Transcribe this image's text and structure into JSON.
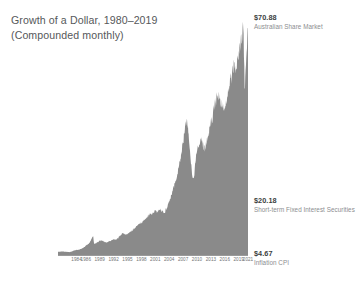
{
  "title": {
    "line1": "Growth of a Dollar, 1980–2019",
    "line2": "(Compounded monthly)"
  },
  "labels": {
    "equities": {
      "value": "$70.88",
      "name": "Australian Share Market"
    },
    "fixed": {
      "value": "$20.18",
      "name": "Short-term Fixed Interest Securities"
    },
    "inflation": {
      "value": "$4.67",
      "name": "Inflation CPI"
    }
  },
  "colors": {
    "area_fill": "#8a8a8a",
    "axis": "#9a9a9a",
    "title_text": "#56585a",
    "tick_text": "#707274",
    "value_text": "#3d3f41",
    "name_text": "#8b8d8f",
    "background": "#ffffff"
  },
  "chart_data": {
    "type": "area",
    "title": "Growth of a Dollar, 1980–2019 (Compounded monthly)",
    "xlabel": "",
    "ylabel": "",
    "grid": false,
    "legend_position": "right-inline-endpoint-labels",
    "yscale": "linear",
    "ylim": [
      0,
      75
    ],
    "xlim": [
      1980,
      2021
    ],
    "tick_labels": [
      "1984",
      "1986",
      "1989",
      "1992",
      "1995",
      "1998",
      "2001",
      "2004",
      "2007",
      "2010",
      "2013",
      "2016",
      "2019",
      "2021"
    ],
    "tick_values": [
      1984,
      1986,
      1989,
      1992,
      1995,
      1998,
      2001,
      2004,
      2007,
      2010,
      2013,
      2016,
      2019,
      2021
    ],
    "endpoint_labels": [
      {
        "label": "Australian Share Market",
        "value": 70.88,
        "display": "$70.88"
      },
      {
        "label": "Short-term Fixed Interest Securities",
        "value": 20.18,
        "display": "$20.18"
      },
      {
        "label": "Inflation CPI",
        "value": 4.67,
        "display": "$4.67"
      }
    ],
    "series": [
      {
        "name": "Australian Share Market",
        "x": [
          1980.0,
          1980.5,
          1981.0,
          1981.5,
          1982.0,
          1982.5,
          1983.0,
          1983.5,
          1984.0,
          1984.5,
          1985.0,
          1985.5,
          1986.0,
          1986.5,
          1987.0,
          1987.3,
          1987.6,
          1987.8,
          1988.0,
          1988.5,
          1989.0,
          1989.5,
          1990.0,
          1990.5,
          1991.0,
          1991.5,
          1992.0,
          1992.5,
          1993.0,
          1993.5,
          1994.0,
          1994.5,
          1995.0,
          1995.5,
          1996.0,
          1996.5,
          1997.0,
          1997.5,
          1998.0,
          1998.5,
          1999.0,
          1999.5,
          2000.0,
          2000.5,
          2001.0,
          2001.5,
          2002.0,
          2002.5,
          2003.0,
          2003.5,
          2004.0,
          2004.5,
          2005.0,
          2005.5,
          2006.0,
          2006.5,
          2007.0,
          2007.5,
          2007.8,
          2008.0,
          2008.5,
          2009.0,
          2009.3,
          2009.8,
          2010.0,
          2010.5,
          2011.0,
          2011.5,
          2012.0,
          2012.5,
          2013.0,
          2013.5,
          2014.0,
          2014.5,
          2015.0,
          2015.5,
          2016.0,
          2016.5,
          2017.0,
          2017.5,
          2018.0,
          2018.5,
          2019.0,
          2019.5,
          2020.0,
          2020.3,
          2020.8,
          2021.0
        ],
        "values": [
          1.0,
          1.05,
          1.12,
          1.05,
          0.98,
          0.92,
          1.15,
          1.45,
          1.6,
          1.68,
          1.95,
          2.3,
          2.9,
          3.4,
          4.3,
          5.2,
          5.9,
          3.4,
          3.6,
          4.0,
          4.5,
          4.6,
          4.2,
          3.9,
          4.3,
          4.6,
          5.0,
          4.9,
          5.4,
          6.2,
          6.9,
          6.4,
          6.6,
          7.1,
          7.8,
          8.3,
          9.2,
          9.8,
          10.2,
          10.8,
          11.6,
          12.4,
          13.0,
          13.4,
          14.0,
          13.6,
          14.5,
          14.0,
          13.5,
          15.0,
          17.0,
          19.0,
          21.5,
          24.0,
          27.0,
          31.0,
          36.0,
          41.0,
          43.5,
          40.0,
          32.0,
          25.0,
          23.5,
          31.0,
          33.0,
          35.0,
          36.5,
          33.0,
          35.0,
          38.0,
          42.0,
          45.0,
          48.0,
          50.0,
          49.0,
          47.5,
          46.0,
          50.0,
          54.0,
          57.0,
          60.0,
          58.0,
          64.0,
          68.0,
          70.88,
          52.0,
          66.0,
          70.88
        ]
      },
      {
        "name": "Short-term Fixed Interest Securities",
        "x": [
          1980,
          1985,
          1990,
          1995,
          2000,
          2005,
          2010,
          2015,
          2019,
          2021
        ],
        "values": [
          1.0,
          1.9,
          3.6,
          5.7,
          8.0,
          10.6,
          13.6,
          17.2,
          19.6,
          20.18
        ]
      },
      {
        "name": "Inflation CPI",
        "x": [
          1980,
          1985,
          1990,
          1995,
          2000,
          2005,
          2010,
          2015,
          2019,
          2021
        ],
        "values": [
          1.0,
          1.45,
          2.05,
          2.5,
          2.95,
          3.4,
          3.95,
          4.3,
          4.55,
          4.67
        ]
      }
    ]
  }
}
